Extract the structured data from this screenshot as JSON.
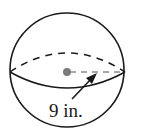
{
  "figure": {
    "shape": "sphere",
    "radius_label": "9 in.",
    "colors": {
      "stroke": "#1a1a1a",
      "center_dot": "#7a7a7a",
      "dashed_radius": "#8a8a8a",
      "background": "#ffffff"
    }
  }
}
